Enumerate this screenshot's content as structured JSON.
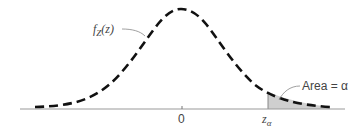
{
  "figure": {
    "curve_label": "f",
    "curve_label_sub": "Z",
    "curve_label_arg": "(z)",
    "tick_zero": "0",
    "critical_label": "z",
    "critical_label_sub": "α",
    "area_label": "Area = α"
  },
  "colors": {
    "curve": "#111111",
    "axis": "#9a9a9a",
    "shade": "#cfcfcf",
    "text": "#444444"
  }
}
